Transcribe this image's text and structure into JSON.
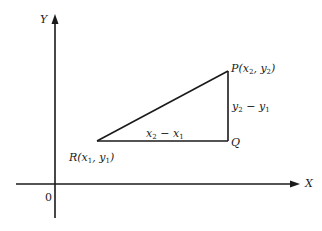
{
  "diagram": {
    "type": "coordinate-geometry",
    "axes": {
      "x_label": "X",
      "y_label": "Y",
      "origin_label": "0"
    },
    "points": {
      "P": {
        "name": "P",
        "coord1": "x",
        "coord1_sub": "2",
        "coord2": "y",
        "coord2_sub": "2"
      },
      "R": {
        "name": "R",
        "coord1": "x",
        "coord1_sub": "1",
        "coord2": "y",
        "coord2_sub": "1"
      },
      "Q": {
        "name": "Q"
      }
    },
    "segments": {
      "horizontal": {
        "a": "x",
        "a_sub": "2",
        "op": " − ",
        "b": "x",
        "b_sub": "1"
      },
      "vertical": {
        "a": "y",
        "a_sub": "2",
        "op": " − ",
        "b": "y",
        "b_sub": "1"
      }
    },
    "colors": {
      "line": "#1a1a1a",
      "background": "#ffffff"
    }
  }
}
